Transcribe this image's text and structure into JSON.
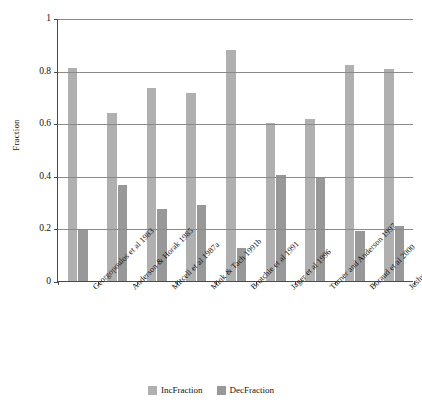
{
  "chart_data": {
    "type": "bar",
    "title": "",
    "xlabel": "",
    "ylabel": "Fraction",
    "ylim": [
      0,
      1
    ],
    "yticks": [
      "0",
      "0.2",
      "0.4",
      "0.6",
      "0.8",
      "1"
    ],
    "ytick_values": [
      0,
      0.2,
      0.4,
      0.6,
      0.8,
      1
    ],
    "grid": "horizontal",
    "legend_position": "bottom-center",
    "categories": [
      "Georgopoulos et al 1983",
      "Anderson & Horak 1985",
      "Mitcell et al 1987a",
      "Mink & Tach 1991b",
      "Brotchie et al 1991",
      "Jager et al 1996",
      "Turner and Anderson 1997",
      "Boraud et al 2000",
      "Joshua et al 2009"
    ],
    "series": [
      {
        "name": "IncFraction",
        "color": "#b0b0b0",
        "values": [
          0.81,
          0.64,
          0.735,
          0.715,
          0.88,
          0.6,
          0.615,
          0.82,
          0.805
        ]
      },
      {
        "name": "DecFraction",
        "color": "#989898",
        "values": [
          0.195,
          0.365,
          0.275,
          0.29,
          0.125,
          0.405,
          0.39,
          0.19,
          0.21
        ]
      }
    ]
  },
  "legend": {
    "items": [
      {
        "label": "IncFraction",
        "color": "#b0b0b0"
      },
      {
        "label": "DecFraction",
        "color": "#989898"
      }
    ]
  },
  "axis": {
    "y_title": "Fraction"
  }
}
